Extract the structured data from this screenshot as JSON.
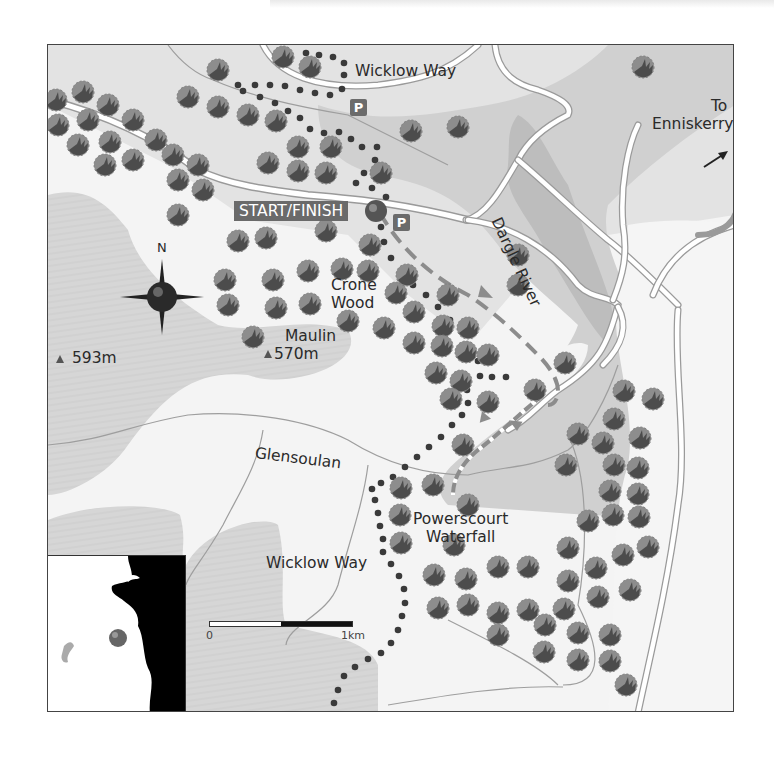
{
  "map": {
    "title": "Powerscourt Waterfall / Crone Wood walk",
    "labels": {
      "wicklow_way_top": "Wicklow Way",
      "wicklow_way_bottom": "Wicklow Way",
      "to_enniskerry_line1": "To",
      "to_enniskerry_line2": "Enniskerry",
      "dargle_river": "Dargle River",
      "start_finish": "START/FINISH",
      "crone_line1": "Crone",
      "crone_line2": "Wood",
      "maulin_line1": "Maulin",
      "maulin_height": "570m",
      "peak_593": "593m",
      "glensoulan": "Glensoulan",
      "powerscourt_line1": "Powerscourt",
      "powerscourt_line2": "Waterfall",
      "compass_north": "N"
    },
    "parking": [
      "P",
      "P"
    ],
    "scale": {
      "start": "0",
      "end": "1km"
    },
    "icons": {
      "compass": "compass-rose-icon",
      "start_marker": "sphere-marker-icon",
      "parking": "parking-icon",
      "direction_arrow": "arrow-northeast-icon",
      "peak": "triangle-peak-icon",
      "tree": "tree-icon"
    },
    "colors": {
      "background": "#f4f4f4",
      "valley_shade": "#dcdcdc",
      "hill_shade": "#d3d3d3",
      "river_band": "#c4c4c4",
      "road": "#ffffff",
      "road_edge": "#9a9a9a",
      "tree_light": "#8a8a8a",
      "tree_dark": "#4a4a4a",
      "dotted_path": "#3a3a3a",
      "dashed_route": "#8c8c8c",
      "badge": "#6a6a6a"
    }
  }
}
